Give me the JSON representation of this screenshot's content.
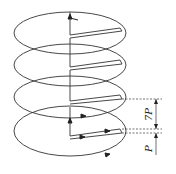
{
  "diagram": {
    "type": "helical-coil-schematic",
    "turns": 4,
    "stroke_color": "#333333",
    "background": "#ffffff",
    "dimensions": [
      {
        "label": "7P",
        "description": "pitch span between upper tab and lower tab"
      },
      {
        "label": "P",
        "description": "pitch between adjacent conductor lines"
      }
    ]
  }
}
